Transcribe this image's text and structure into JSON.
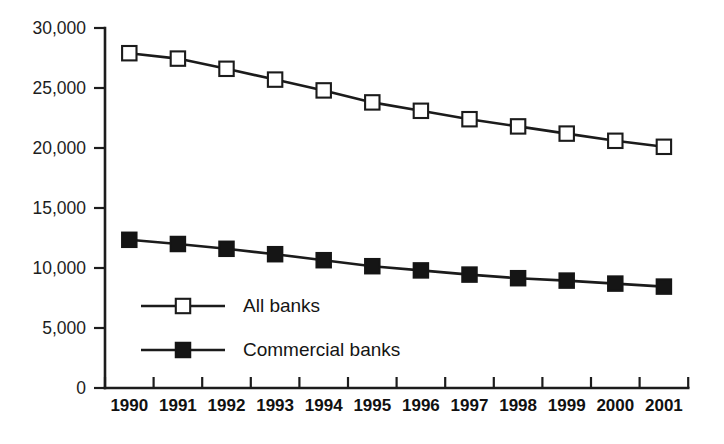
{
  "chart_data": {
    "type": "line",
    "title": "",
    "subtitle": "",
    "xlabel": "",
    "ylabel": "",
    "categories": [
      "1990",
      "1991",
      "1992",
      "1993",
      "1994",
      "1995",
      "1996",
      "1997",
      "1998",
      "1999",
      "2000",
      "2001"
    ],
    "ylim": [
      0,
      30000
    ],
    "y_ticks": [
      0,
      5000,
      10000,
      15000,
      20000,
      25000,
      30000
    ],
    "y_tick_labels": [
      "0",
      "5,000",
      "10,000",
      "15,000",
      "20,000",
      "25,000",
      "30,000"
    ],
    "grid": false,
    "legend_position": "inside-lower-left",
    "series": [
      {
        "name": "All banks",
        "marker": "open-square",
        "color": "#1b1b1b",
        "values": [
          27900,
          27450,
          26600,
          25700,
          24800,
          23800,
          23100,
          22400,
          21800,
          21200,
          20600,
          20100
        ]
      },
      {
        "name": "Commercial banks",
        "marker": "filled-square",
        "color": "#151515",
        "values": [
          12350,
          12000,
          11600,
          11150,
          10650,
          10150,
          9800,
          9450,
          9150,
          8950,
          8700,
          8450
        ]
      }
    ]
  },
  "axes": {
    "y_tick_labels": [
      "30,000",
      "25,000",
      "20,000",
      "15,000",
      "10,000",
      "5,000",
      "0"
    ],
    "x_tick_labels": [
      "1990",
      "1991",
      "1992",
      "1993",
      "1994",
      "1995",
      "1996",
      "1997",
      "1998",
      "1999",
      "2000",
      "2001"
    ]
  },
  "legend": {
    "entries": [
      {
        "label": "All banks",
        "marker": "open-square"
      },
      {
        "label": "Commercial banks",
        "marker": "filled-square"
      }
    ]
  },
  "colors": {
    "line": "#1b1b1b",
    "marker_fill_open": "#ffffff",
    "marker_fill_closed": "#151515",
    "axis": "#1c1c1c",
    "text": "#1a1a1a",
    "background": "#ffffff"
  }
}
